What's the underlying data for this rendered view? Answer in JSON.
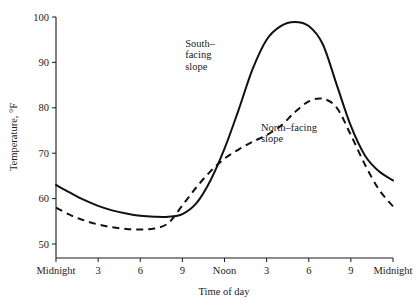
{
  "chart_data": {
    "type": "line",
    "title": "",
    "subtitle": "",
    "xlabel": "Time of day",
    "ylabel": "Temperature, °F",
    "xlim": [
      0,
      24
    ],
    "ylim": [
      47,
      103
    ],
    "grid": false,
    "legend_position": "inline-annotations",
    "x_tick_labels": [
      "Midnight",
      "3",
      "6",
      "9",
      "Noon",
      "3",
      "6",
      "9",
      "Midnight"
    ],
    "x_tick_values": [
      0,
      3,
      6,
      9,
      12,
      15,
      18,
      21,
      24
    ],
    "y_tick_labels": [
      "50",
      "60",
      "70",
      "80",
      "90",
      "100"
    ],
    "y_tick_values": [
      50,
      60,
      70,
      80,
      90,
      100
    ],
    "annotations": [
      {
        "name": "south-facing-slope-label",
        "lines": [
          "South–",
          "facing",
          "slope"
        ],
        "x_hours": 9.2,
        "y_temp": 93.5
      },
      {
        "name": "north-facing-slope-label",
        "lines": [
          "North–facing",
          "slope"
        ],
        "x_hours": 14.6,
        "y_temp": 75.0
      }
    ],
    "x": [
      0,
      1,
      2,
      3,
      4,
      5,
      6,
      7,
      8,
      9,
      10,
      11,
      12,
      13,
      14,
      15,
      16,
      17,
      18,
      19,
      20,
      21,
      22,
      23,
      24
    ],
    "series": [
      {
        "name": "South-facing slope",
        "style": "solid",
        "color": "#111111",
        "values": [
          63.0,
          61.3,
          59.7,
          58.4,
          57.4,
          56.7,
          56.2,
          56.0,
          56.0,
          56.6,
          59.0,
          64.0,
          71.0,
          79.5,
          88.5,
          95.0,
          98.0,
          98.9,
          98.0,
          94.0,
          85.0,
          76.0,
          69.5,
          66.0,
          64.0
        ]
      },
      {
        "name": "North-facing slope",
        "style": "dashed",
        "color": "#111111",
        "values": [
          58.0,
          56.4,
          55.2,
          54.3,
          53.7,
          53.3,
          53.2,
          53.4,
          54.6,
          58.5,
          62.5,
          66.0,
          68.8,
          70.8,
          72.5,
          74.0,
          76.0,
          79.0,
          81.4,
          82.0,
          80.0,
          74.0,
          67.5,
          62.0,
          58.3
        ]
      }
    ]
  }
}
